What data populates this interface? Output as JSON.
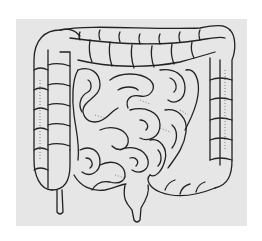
{
  "image": {
    "subject": "intestines-line-drawing",
    "background_color": "#ffffff",
    "panel_color": "#e6e6e6",
    "stroke_color": "#222222"
  }
}
